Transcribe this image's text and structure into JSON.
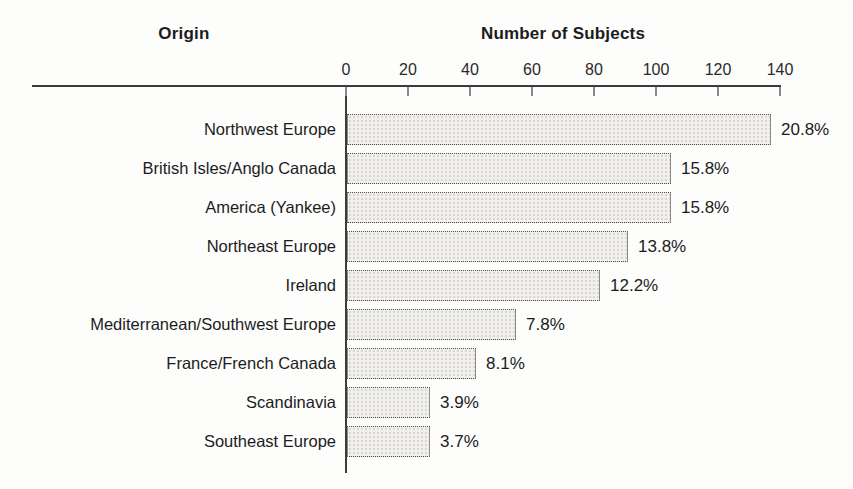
{
  "page": {
    "background": "#fdfdfc",
    "text_color": "#1c1c1c"
  },
  "header": {
    "origin": "Origin",
    "subjects": "Number of Subjects"
  },
  "chart_data": {
    "type": "bar",
    "orientation": "horizontal",
    "title": "",
    "xlabel": "Number of Subjects",
    "ylabel": "Origin",
    "xlim": [
      0,
      140
    ],
    "xticks": [
      0,
      20,
      40,
      60,
      80,
      100,
      120,
      140
    ],
    "grid": false,
    "legend": "none",
    "categories": [
      "Northwest Europe",
      "British Isles/Anglo Canada",
      "America (Yankee)",
      "Northeast Europe",
      "Ireland",
      "Mediterranean/Southwest Europe",
      "France/French Canada",
      "Scandinavia",
      "Southeast Europe"
    ],
    "values": [
      136,
      104,
      104,
      90,
      81,
      54,
      41,
      26,
      26
    ],
    "value_labels": [
      "20.8%",
      "15.8%",
      "15.8%",
      "13.8%",
      "12.2%",
      "7.8%",
      "8.1%",
      "3.9%",
      "3.7%"
    ],
    "bar_fill": "#f1f0ed",
    "bar_border": "#8a8a8a",
    "axis_color": "#3c3c3c"
  }
}
